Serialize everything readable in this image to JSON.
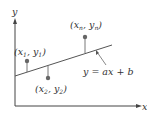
{
  "diagram": {
    "axes": {
      "x_label": "x",
      "y_label": "y"
    },
    "line": {
      "equation": "y = ax + b"
    },
    "points": [
      {
        "label_x": "x",
        "label_x_sub": "1",
        "label_y": "y",
        "label_y_sub": "1"
      },
      {
        "label_x": "x",
        "label_x_sub": "2",
        "label_y": "y",
        "label_y_sub": "2"
      },
      {
        "label_x": "x",
        "label_x_sub": "n",
        "label_y": "y",
        "label_y_sub": "n"
      }
    ],
    "colors": {
      "axis": "#444444",
      "line": "#555555",
      "point": "#666666",
      "text": "#333333"
    }
  }
}
